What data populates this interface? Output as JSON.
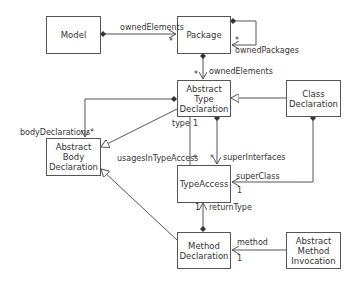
{
  "diagram": {
    "type": "UML class diagram",
    "classes": {
      "model": "Model",
      "package": "Package",
      "abstract_type_declaration": [
        "Abstract",
        "Type",
        "Declaration"
      ],
      "class_declaration": [
        "Class",
        "Declaration"
      ],
      "abstract_body_declaration": [
        "Abstract",
        "Body",
        "Declaration"
      ],
      "type_access": "TypeAccess",
      "method_declaration": [
        "Method",
        "Declaration"
      ],
      "abstract_method_invocation": [
        "Abstract",
        "Method",
        "Invocation"
      ]
    },
    "labels": {
      "model_owned_elements": "ownedElements",
      "model_owned_elements_mult": "*",
      "owned_packages": "ownedPackages",
      "owned_packages_mult": "*",
      "package_owned_elements": "ownedElements",
      "package_owned_elements_mult": "*",
      "body_declarations": "bodyDeclarations",
      "body_declarations_mult": "*",
      "type": "type",
      "type_mult": "1",
      "usages_in_type_access": "usagesInTypeAccess",
      "usages_mult": "*",
      "super_interfaces": "superInterfaces",
      "super_interfaces_mult": "*",
      "super_class": "superClass",
      "super_class_mult": "1",
      "return_type": "returnType",
      "return_type_mult": "1",
      "method": "method",
      "method_mult": "1"
    },
    "relationships": [
      {
        "from": "Model",
        "to": "Package",
        "kind": "composition",
        "role": "ownedElements",
        "mult": "*"
      },
      {
        "from": "Package",
        "to": "Package",
        "kind": "composition",
        "role": "ownedPackages",
        "mult": "*"
      },
      {
        "from": "Package",
        "to": "Abstract Type Declaration",
        "kind": "composition",
        "role": "ownedElements",
        "mult": "*"
      },
      {
        "from": "Abstract Type Declaration",
        "to": "Abstract Body Declaration",
        "kind": "composition",
        "role": "bodyDeclarations",
        "mult": "*"
      },
      {
        "from": "Abstract Type Declaration",
        "to": "Abstract Body Declaration",
        "kind": "generalization"
      },
      {
        "from": "Class Declaration",
        "to": "Abstract Type Declaration",
        "kind": "generalization"
      },
      {
        "from": "Abstract Type Declaration",
        "to": "TypeAccess",
        "kind": "association",
        "role": "usagesInTypeAccess / type",
        "mult": "* / 1"
      },
      {
        "from": "Abstract Type Declaration",
        "to": "TypeAccess",
        "kind": "composition",
        "role": "superInterfaces",
        "mult": "*"
      },
      {
        "from": "Class Declaration",
        "to": "TypeAccess",
        "kind": "composition",
        "role": "superClass",
        "mult": "1"
      },
      {
        "from": "Method Declaration",
        "to": "TypeAccess",
        "kind": "composition",
        "role": "returnType",
        "mult": "1"
      },
      {
        "from": "Method Declaration",
        "to": "Abstract Body Declaration",
        "kind": "generalization"
      },
      {
        "from": "Abstract Method Invocation",
        "to": "Method Declaration",
        "kind": "association",
        "role": "method",
        "mult": "1"
      }
    ]
  }
}
